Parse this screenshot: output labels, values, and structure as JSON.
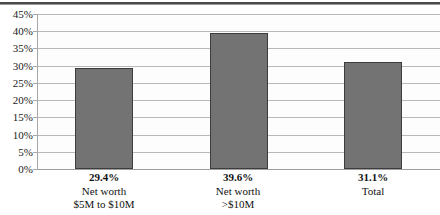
{
  "chart_data": {
    "type": "bar",
    "title": "",
    "subtitle": "",
    "xlabel": "",
    "ylabel": "",
    "grid": true,
    "legend": false,
    "ylim": [
      0,
      45
    ],
    "ytick_step": 5,
    "ytick_labels": [
      "45%",
      "40%",
      "35%",
      "30%",
      "25%",
      "20%",
      "15%",
      "10%",
      "5%",
      "0%"
    ],
    "ytick_values": [
      45,
      40,
      35,
      30,
      25,
      20,
      15,
      10,
      5,
      0
    ],
    "categories": [
      "Net worth $5M to $10M",
      "Net worth >$10M",
      "Total"
    ],
    "category_lines": [
      [
        "Net worth",
        "$5M to $10M"
      ],
      [
        "Net worth",
        ">$10M"
      ],
      [
        "Total"
      ]
    ],
    "values": [
      29.4,
      39.6,
      31.1
    ],
    "data_labels": [
      "29.4%",
      "39.6%",
      "31.1%"
    ],
    "bar_color": "#737373",
    "bar_border_color": "#3d3d3d",
    "gridline_color": "#b9b9b9",
    "plot_background": "#fdfdfd"
  }
}
